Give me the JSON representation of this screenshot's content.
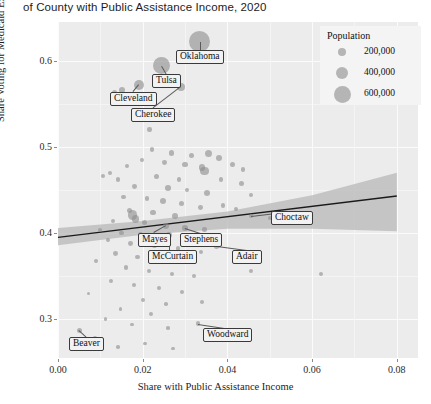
{
  "title": "of County with Public Assistance Income, 2020",
  "axis": {
    "ylabel": "Share Voting for Medicaid Expansion",
    "xlabel": "Share with Public Assistance Income",
    "yticks": [
      "0.3",
      "0.4",
      "0.5",
      "0.6"
    ],
    "xticks": [
      "0.00",
      "0.02",
      "0.04",
      "0.06",
      "0.08"
    ]
  },
  "legend": {
    "title": "Population",
    "entries": [
      {
        "label": "200,000",
        "value": 200000
      },
      {
        "label": "400,000",
        "value": 400000
      },
      {
        "label": "600,000",
        "value": 600000
      }
    ]
  },
  "callouts": [
    {
      "label": "Oklahoma"
    },
    {
      "label": "Tulsa"
    },
    {
      "label": "Cleveland"
    },
    {
      "label": "Cherokee"
    },
    {
      "label": "Choctaw"
    },
    {
      "label": "Mayes"
    },
    {
      "label": "Stephens"
    },
    {
      "label": "McCurtain"
    },
    {
      "label": "Adair"
    },
    {
      "label": "Beaver"
    },
    {
      "label": "Woodward"
    }
  ],
  "colors": {
    "panel": "#ececed",
    "grid": "#fbfbfb",
    "point": "#8e8e8e",
    "trendline": "#1a1a1a",
    "ribbon": "#b8b8b8",
    "legend_bg": "#f4f4f4",
    "callout_bg": "#f2f2f2",
    "callout_border": "#3a3a3a",
    "text": "#1c1c1c"
  },
  "chart_data": {
    "type": "scatter",
    "title": "of County with Public Assistance Income, 2020",
    "xlabel": "Share with Public Assistance Income",
    "ylabel": "Share Voting for Medicaid Expansion",
    "xlim": [
      0.0,
      0.085
    ],
    "ylim": [
      0.255,
      0.645
    ],
    "grid": true,
    "legend": {
      "position": "top-right",
      "title": "Population",
      "sizes": [
        200000,
        400000,
        600000
      ]
    },
    "size_encoding": "Population",
    "trendline": {
      "type": "linear-fit",
      "x": [
        0.0,
        0.08
      ],
      "y": [
        0.395,
        0.443
      ],
      "band": {
        "x": [
          0.0,
          0.02,
          0.04,
          0.06,
          0.08
        ],
        "lower": [
          0.386,
          0.398,
          0.405,
          0.405,
          0.402
        ],
        "upper": [
          0.406,
          0.414,
          0.425,
          0.444,
          0.47
        ]
      }
    },
    "labeled_points": [
      {
        "name": "Oklahoma",
        "x": 0.0335,
        "y": 0.622,
        "population": 600000
      },
      {
        "name": "Tulsa",
        "x": 0.0245,
        "y": 0.594,
        "population": 450000
      },
      {
        "name": "Cleveland",
        "x": 0.0192,
        "y": 0.572,
        "population": 200000
      },
      {
        "name": "Cherokee",
        "x": 0.029,
        "y": 0.57,
        "population": 130000
      },
      {
        "name": "Choctaw",
        "x": 0.0455,
        "y": 0.42,
        "population": 70000
      },
      {
        "name": "Mayes",
        "x": 0.0256,
        "y": 0.408,
        "population": 90000
      },
      {
        "name": "Stephens",
        "x": 0.03,
        "y": 0.406,
        "population": 95000
      },
      {
        "name": "McCurtain",
        "x": 0.0262,
        "y": 0.398,
        "population": 80000
      },
      {
        "name": "Adair",
        "x": 0.0375,
        "y": 0.385,
        "population": 75000
      },
      {
        "name": "Beaver",
        "x": 0.005,
        "y": 0.287,
        "population": 60000
      },
      {
        "name": "Woodward",
        "x": 0.033,
        "y": 0.295,
        "population": 60000
      }
    ],
    "points": [
      {
        "x": 0.0335,
        "y": 0.622,
        "r": 10.5
      },
      {
        "x": 0.0245,
        "y": 0.594,
        "r": 8.5
      },
      {
        "x": 0.0192,
        "y": 0.572,
        "r": 5.0
      },
      {
        "x": 0.029,
        "y": 0.57,
        "r": 4.0
      },
      {
        "x": 0.015,
        "y": 0.566,
        "r": 3.0
      },
      {
        "x": 0.0133,
        "y": 0.563,
        "r": 2.6
      },
      {
        "x": 0.0216,
        "y": 0.52,
        "r": 2.2
      },
      {
        "x": 0.0222,
        "y": 0.497,
        "r": 2.4
      },
      {
        "x": 0.0268,
        "y": 0.493,
        "r": 2.8
      },
      {
        "x": 0.0315,
        "y": 0.49,
        "r": 2.6
      },
      {
        "x": 0.0356,
        "y": 0.492,
        "r": 3.6
      },
      {
        "x": 0.038,
        "y": 0.487,
        "r": 3.0
      },
      {
        "x": 0.0198,
        "y": 0.485,
        "r": 2.2
      },
      {
        "x": 0.0164,
        "y": 0.478,
        "r": 2.0
      },
      {
        "x": 0.0252,
        "y": 0.482,
        "r": 2.4
      },
      {
        "x": 0.03,
        "y": 0.48,
        "r": 2.6
      },
      {
        "x": 0.034,
        "y": 0.476,
        "r": 3.2
      },
      {
        "x": 0.0346,
        "y": 0.472,
        "r": 4.2
      },
      {
        "x": 0.0412,
        "y": 0.48,
        "r": 2.6
      },
      {
        "x": 0.0437,
        "y": 0.474,
        "r": 2.4
      },
      {
        "x": 0.0122,
        "y": 0.47,
        "r": 2.0
      },
      {
        "x": 0.0106,
        "y": 0.466,
        "r": 2.0
      },
      {
        "x": 0.0141,
        "y": 0.462,
        "r": 2.2
      },
      {
        "x": 0.0232,
        "y": 0.466,
        "r": 2.6
      },
      {
        "x": 0.0285,
        "y": 0.462,
        "r": 2.2
      },
      {
        "x": 0.0385,
        "y": 0.462,
        "r": 2.4
      },
      {
        "x": 0.0433,
        "y": 0.458,
        "r": 2.6
      },
      {
        "x": 0.0181,
        "y": 0.454,
        "r": 2.4
      },
      {
        "x": 0.026,
        "y": 0.452,
        "r": 2.8
      },
      {
        "x": 0.0305,
        "y": 0.45,
        "r": 2.2
      },
      {
        "x": 0.0352,
        "y": 0.446,
        "r": 3.0
      },
      {
        "x": 0.0455,
        "y": 0.444,
        "r": 2.2
      },
      {
        "x": 0.0155,
        "y": 0.442,
        "r": 2.2
      },
      {
        "x": 0.021,
        "y": 0.44,
        "r": 2.4
      },
      {
        "x": 0.0248,
        "y": 0.437,
        "r": 3.2
      },
      {
        "x": 0.0292,
        "y": 0.434,
        "r": 2.6
      },
      {
        "x": 0.0336,
        "y": 0.43,
        "r": 2.4
      },
      {
        "x": 0.039,
        "y": 0.432,
        "r": 2.2
      },
      {
        "x": 0.042,
        "y": 0.428,
        "r": 2.0
      },
      {
        "x": 0.0168,
        "y": 0.426,
        "r": 2.6
      },
      {
        "x": 0.0176,
        "y": 0.421,
        "r": 4.6
      },
      {
        "x": 0.0183,
        "y": 0.416,
        "r": 3.8
      },
      {
        "x": 0.0224,
        "y": 0.424,
        "r": 2.8
      },
      {
        "x": 0.0276,
        "y": 0.42,
        "r": 3.0
      },
      {
        "x": 0.0455,
        "y": 0.42,
        "r": 2.2
      },
      {
        "x": 0.05,
        "y": 0.418,
        "r": 2.0
      },
      {
        "x": 0.013,
        "y": 0.414,
        "r": 2.2
      },
      {
        "x": 0.0205,
        "y": 0.412,
        "r": 2.6
      },
      {
        "x": 0.0256,
        "y": 0.408,
        "r": 3.0
      },
      {
        "x": 0.03,
        "y": 0.406,
        "r": 2.8
      },
      {
        "x": 0.0346,
        "y": 0.404,
        "r": 2.2
      },
      {
        "x": 0.0098,
        "y": 0.404,
        "r": 2.0
      },
      {
        "x": 0.015,
        "y": 0.4,
        "r": 2.4
      },
      {
        "x": 0.0195,
        "y": 0.398,
        "r": 2.6
      },
      {
        "x": 0.0262,
        "y": 0.398,
        "r": 2.8
      },
      {
        "x": 0.031,
        "y": 0.394,
        "r": 3.2
      },
      {
        "x": 0.0375,
        "y": 0.385,
        "r": 2.6
      },
      {
        "x": 0.0118,
        "y": 0.392,
        "r": 2.2
      },
      {
        "x": 0.0172,
        "y": 0.388,
        "r": 2.4
      },
      {
        "x": 0.0228,
        "y": 0.386,
        "r": 2.6
      },
      {
        "x": 0.0284,
        "y": 0.382,
        "r": 2.2
      },
      {
        "x": 0.0338,
        "y": 0.378,
        "r": 2.0
      },
      {
        "x": 0.0136,
        "y": 0.376,
        "r": 2.4
      },
      {
        "x": 0.0188,
        "y": 0.372,
        "r": 2.2
      },
      {
        "x": 0.024,
        "y": 0.37,
        "r": 2.6
      },
      {
        "x": 0.0296,
        "y": 0.366,
        "r": 2.0
      },
      {
        "x": 0.0415,
        "y": 0.372,
        "r": 2.0
      },
      {
        "x": 0.009,
        "y": 0.368,
        "r": 2.0
      },
      {
        "x": 0.016,
        "y": 0.36,
        "r": 2.2
      },
      {
        "x": 0.0215,
        "y": 0.356,
        "r": 2.4
      },
      {
        "x": 0.0268,
        "y": 0.352,
        "r": 2.0
      },
      {
        "x": 0.032,
        "y": 0.35,
        "r": 2.0
      },
      {
        "x": 0.0455,
        "y": 0.356,
        "r": 2.0
      },
      {
        "x": 0.062,
        "y": 0.352,
        "r": 2.0
      },
      {
        "x": 0.0125,
        "y": 0.344,
        "r": 2.0
      },
      {
        "x": 0.018,
        "y": 0.34,
        "r": 2.2
      },
      {
        "x": 0.0238,
        "y": 0.336,
        "r": 2.0
      },
      {
        "x": 0.0292,
        "y": 0.332,
        "r": 2.0
      },
      {
        "x": 0.0072,
        "y": 0.33,
        "r": 1.8
      },
      {
        "x": 0.02,
        "y": 0.322,
        "r": 2.0
      },
      {
        "x": 0.0255,
        "y": 0.318,
        "r": 1.8
      },
      {
        "x": 0.034,
        "y": 0.32,
        "r": 2.0
      },
      {
        "x": 0.0148,
        "y": 0.312,
        "r": 1.8
      },
      {
        "x": 0.022,
        "y": 0.306,
        "r": 2.0
      },
      {
        "x": 0.005,
        "y": 0.287,
        "r": 2.6
      },
      {
        "x": 0.033,
        "y": 0.295,
        "r": 2.2
      },
      {
        "x": 0.0112,
        "y": 0.3,
        "r": 1.8
      },
      {
        "x": 0.0175,
        "y": 0.294,
        "r": 1.8
      },
      {
        "x": 0.026,
        "y": 0.29,
        "r": 1.8
      },
      {
        "x": 0.0088,
        "y": 0.278,
        "r": 1.8
      },
      {
        "x": 0.0205,
        "y": 0.272,
        "r": 1.8
      },
      {
        "x": 0.0142,
        "y": 0.268,
        "r": 1.8
      },
      {
        "x": 0.0272,
        "y": 0.266,
        "r": 1.8
      }
    ]
  }
}
